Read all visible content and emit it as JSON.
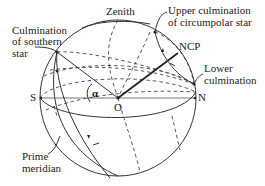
{
  "diagram": {
    "labels": {
      "zenith": "Zenith",
      "southern_line1": "Culmination",
      "southern_line2": "of southern",
      "southern_line3": "star",
      "upper_line1": "Upper culmination",
      "upper_line2": "of circumpolar star",
      "ncp": "NCP",
      "lower_line1": "Lower",
      "lower_line2": "culmination",
      "south": "S",
      "north": "N",
      "origin": "O",
      "angle": "α",
      "prime_line1": "Prime",
      "prime_line2": "meridian"
    },
    "colors": {
      "line": "#333333",
      "horizon": "#777777",
      "text": "#222222"
    }
  }
}
